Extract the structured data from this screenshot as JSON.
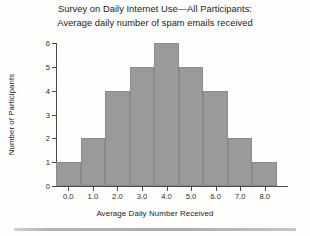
{
  "chart_data": {
    "type": "bar",
    "title": "Survey on Daily Internet Use—All Participants: Average daily number of spam emails received",
    "title_lines": [
      "Survey on Daily Internet Use—All Participants:",
      "Average daily number of spam emails received"
    ],
    "xlabel": "Average Daily Number Received",
    "ylabel": "Number of Participants",
    "categories": [
      "0.0",
      "1.0",
      "2.0",
      "3.0",
      "4.0",
      "5.0",
      "6.0",
      "7.0",
      "8.0"
    ],
    "values": [
      1,
      2,
      4,
      5,
      6,
      5,
      4,
      2,
      1
    ],
    "xtick_labels": [
      "0.0",
      "1.0",
      "2.0",
      "3.0",
      "4.0",
      "5.0",
      "6.0",
      "7.0",
      "8.0"
    ],
    "ytick_labels": [
      "0",
      "1",
      "2",
      "3",
      "4",
      "5",
      "6"
    ],
    "ytick_values": [
      0,
      1,
      2,
      3,
      4,
      5,
      6
    ],
    "ylim": [
      0,
      6
    ],
    "xlim": [
      -0.5,
      8.5
    ],
    "grid": false,
    "legend": false,
    "bar_color": "#9a9a9a",
    "axis_color": "#4a4a4a",
    "background_color": "#fdfdfb"
  }
}
